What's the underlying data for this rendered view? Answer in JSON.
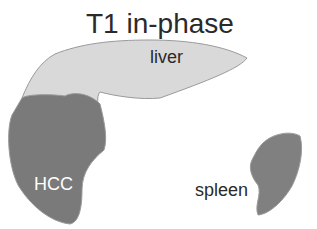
{
  "title": "T1 in-phase",
  "labels": {
    "liver": "liver",
    "hcc": "HCC",
    "spleen": "spleen"
  },
  "colors": {
    "liver_fill": "#d9d9d9",
    "lesion_fill": "#7a7a7a",
    "spleen_fill": "#808080",
    "outline": "#9a9a9a"
  }
}
